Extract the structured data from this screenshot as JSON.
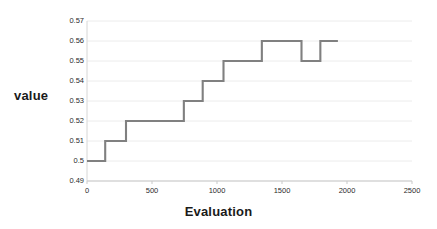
{
  "chart_data": {
    "type": "line",
    "title": "",
    "xlabel": "Evaluation",
    "ylabel": "value",
    "xlim": [
      0,
      2500
    ],
    "ylim": [
      0.49,
      0.57
    ],
    "grid": true,
    "legend": null,
    "step_style": "post",
    "line_color": "#808080",
    "xticks": [
      0,
      500,
      1000,
      1500,
      2000,
      2500
    ],
    "xtick_labels": [
      "0",
      "500",
      "1000",
      "1500",
      "2000",
      "2500"
    ],
    "yticks": [
      0.49,
      0.5,
      0.51,
      0.52,
      0.53,
      0.54,
      0.55,
      0.56,
      0.57
    ],
    "ytick_labels": [
      "0.49",
      "0.5",
      "0.51",
      "0.52",
      "0.53",
      "0.54",
      "0.55",
      "0.56",
      "0.57"
    ],
    "series": [
      {
        "name": "best value",
        "x": [
          0,
          140,
          140,
          300,
          300,
          745,
          745,
          890,
          890,
          1050,
          1050,
          1345,
          1345,
          1650,
          1650,
          1795,
          1795,
          1930
        ],
        "y": [
          0.5,
          0.5,
          0.51,
          0.51,
          0.52,
          0.52,
          0.53,
          0.53,
          0.54,
          0.54,
          0.55,
          0.55,
          0.56,
          0.56,
          0.55,
          0.55,
          0.56,
          0.56
        ]
      }
    ]
  }
}
